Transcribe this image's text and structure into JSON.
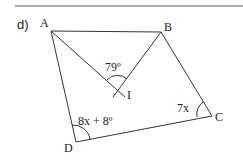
{
  "problem": {
    "part_label": "d)"
  },
  "figure": {
    "vertices": {
      "A": "A",
      "B": "B",
      "C": "C",
      "D": "D",
      "I": "I"
    },
    "angles": {
      "AIB": "79º",
      "D": "8x + 8º",
      "C": "7x"
    }
  },
  "colors": {
    "stroke": "#333333",
    "text": "#222222",
    "background": "#ffffff"
  }
}
